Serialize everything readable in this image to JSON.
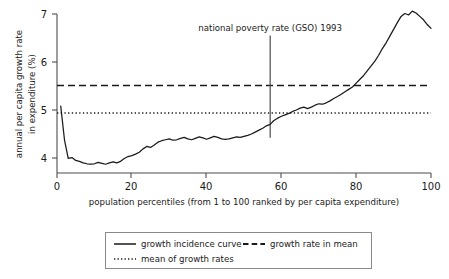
{
  "chart_data": {
    "type": "line",
    "title": "",
    "xlabel": "population percentiles (from 1 to 100 ranked by per capita expenditure)",
    "ylabel": "annual per capita growth rate in expenditure (%)",
    "ylabel_line1": "annual per capita growth rate",
    "ylabel_line2": "in expenditure (%)",
    "xlim": [
      0,
      100
    ],
    "ylim": [
      3.78,
      7.12
    ],
    "grid": false,
    "legend_position": "below-axes",
    "xticks": [
      0,
      20,
      40,
      60,
      80,
      100
    ],
    "xtick_labels": [
      "0",
      "20",
      "40",
      "60",
      "80",
      "100"
    ],
    "yticks": [
      4,
      5,
      6,
      7
    ],
    "ytick_labels": [
      "4",
      "5",
      "6",
      "7"
    ],
    "annotations": [
      {
        "text": "national poverty rate (GSO) 1993",
        "x": 57,
        "y_top": 6.55,
        "y_bottom": 4.42,
        "type": "vertical-line-with-label"
      }
    ],
    "reference_lines": [
      {
        "name": "growth rate in mean",
        "value": 5.51,
        "style": "dashed"
      },
      {
        "name": "mean of growth rates",
        "value": 4.94,
        "style": "dotted"
      }
    ],
    "series": [
      {
        "name": "growth incidence curve",
        "style": "solid",
        "x": [
          1,
          2,
          3,
          4,
          5,
          6,
          7,
          8,
          9,
          10,
          11,
          12,
          13,
          14,
          15,
          16,
          17,
          18,
          19,
          20,
          21,
          22,
          23,
          24,
          25,
          26,
          27,
          28,
          29,
          30,
          31,
          32,
          33,
          34,
          35,
          36,
          37,
          38,
          39,
          40,
          41,
          42,
          43,
          44,
          45,
          46,
          47,
          48,
          49,
          50,
          51,
          52,
          53,
          54,
          55,
          56,
          57,
          58,
          59,
          60,
          61,
          62,
          63,
          64,
          65,
          66,
          67,
          68,
          69,
          70,
          71,
          72,
          73,
          74,
          75,
          76,
          77,
          78,
          79,
          80,
          81,
          82,
          83,
          84,
          85,
          86,
          87,
          88,
          89,
          90,
          91,
          92,
          93,
          94,
          95,
          96,
          97,
          98,
          99,
          100
        ],
        "values": [
          5.08,
          4.38,
          3.99,
          4.01,
          3.95,
          3.93,
          3.9,
          3.88,
          3.87,
          3.88,
          3.91,
          3.89,
          3.87,
          3.9,
          3.92,
          3.9,
          3.93,
          3.99,
          4.03,
          4.05,
          4.08,
          4.12,
          4.19,
          4.24,
          4.22,
          4.27,
          4.33,
          4.36,
          4.38,
          4.4,
          4.37,
          4.38,
          4.41,
          4.43,
          4.4,
          4.38,
          4.41,
          4.44,
          4.42,
          4.39,
          4.42,
          4.45,
          4.43,
          4.4,
          4.39,
          4.4,
          4.42,
          4.44,
          4.43,
          4.45,
          4.47,
          4.5,
          4.54,
          4.58,
          4.62,
          4.67,
          4.7,
          4.78,
          4.83,
          4.87,
          4.9,
          4.93,
          4.97,
          5.0,
          5.04,
          5.06,
          5.03,
          5.06,
          5.1,
          5.13,
          5.12,
          5.15,
          5.19,
          5.24,
          5.28,
          5.33,
          5.38,
          5.43,
          5.48,
          5.56,
          5.64,
          5.72,
          5.82,
          5.92,
          6.02,
          6.14,
          6.28,
          6.4,
          6.54,
          6.68,
          6.82,
          6.95,
          7.01,
          6.98,
          7.06,
          7.02,
          6.95,
          6.88,
          6.78,
          6.7
        ]
      }
    ],
    "legend": [
      {
        "label": "growth incidence curve",
        "style": "solid"
      },
      {
        "label": "growth rate in mean",
        "style": "dashed"
      },
      {
        "label": "mean of growth rates",
        "style": "dotted"
      }
    ]
  },
  "colors": {
    "curve": "#1a1a1a",
    "axis": "#4d4d4d",
    "legend_border": "#8a8a8a",
    "background": "#ffffff"
  }
}
